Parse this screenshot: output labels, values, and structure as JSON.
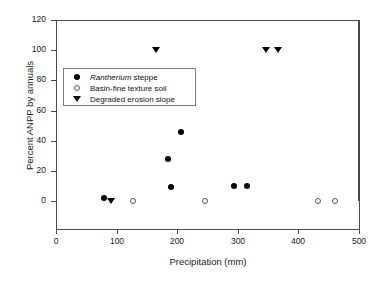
{
  "chart_data": {
    "type": "scatter",
    "title": "",
    "xlabel": "Precipitation (mm)",
    "ylabel": "Percent ANPP by annuals",
    "xlim": [
      0,
      500
    ],
    "ylim": [
      0,
      120
    ],
    "xticks": [
      0,
      100,
      200,
      300,
      400,
      500
    ],
    "yticks": [
      0,
      20,
      40,
      60,
      80,
      100,
      120
    ],
    "xtick_labels": [
      "0",
      "100",
      "200",
      "300",
      "400",
      "500"
    ],
    "ytick_labels": [
      "0",
      "20",
      "40",
      "60",
      "80",
      "100",
      "120"
    ],
    "grid": false,
    "legend_position": "upper left inside",
    "series": [
      {
        "name": "Rantherium steppe",
        "name_italic_prefix": "Rantherium",
        "name_plain_suffix": " steppe",
        "marker": "filled-circle",
        "color": "#000000",
        "points": [
          {
            "x": 80,
            "y": 2
          },
          {
            "x": 190,
            "y": 9
          },
          {
            "x": 185,
            "y": 28
          },
          {
            "x": 207,
            "y": 46
          },
          {
            "x": 293,
            "y": 10
          },
          {
            "x": 316,
            "y": 10
          }
        ]
      },
      {
        "name": "Basin-fine texture soil",
        "marker": "open-circle",
        "color": "#5a5a5a",
        "points": [
          {
            "x": 127,
            "y": 0
          },
          {
            "x": 246,
            "y": 0
          },
          {
            "x": 432,
            "y": 0
          },
          {
            "x": 461,
            "y": 0
          }
        ]
      },
      {
        "name": "Degraded erosion slope",
        "marker": "down-triangle",
        "color": "#000000",
        "points": [
          {
            "x": 91,
            "y": 0
          },
          {
            "x": 165,
            "y": 100
          },
          {
            "x": 346,
            "y": 100
          },
          {
            "x": 366,
            "y": 100
          }
        ]
      }
    ]
  },
  "legend": {
    "items": [
      {
        "label_italic": "Rantherium",
        "label_rest": " steppe",
        "marker": "filled-circle"
      },
      {
        "label_italic": "",
        "label_rest": "Basin-fine texture soil",
        "marker": "open-circle"
      },
      {
        "label_italic": "",
        "label_rest": "Degraded erosion slope",
        "marker": "down-triangle"
      }
    ]
  }
}
